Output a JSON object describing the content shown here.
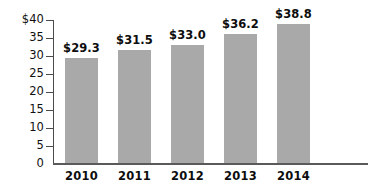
{
  "chart_data": {
    "type": "bar",
    "title": "",
    "subtitle": "",
    "xlabel": "",
    "ylabel": "",
    "categories": [
      "2010",
      "2011",
      "2012",
      "2013",
      "2014"
    ],
    "values": [
      29.3,
      31.5,
      33.0,
      36.2,
      38.8
    ],
    "data_labels": [
      "$29.3",
      "$31.5",
      "$33.0",
      "$36.2",
      "$38.8"
    ],
    "ylim": [
      0,
      40
    ],
    "ytick_values": [
      0,
      5,
      10,
      15,
      20,
      25,
      30,
      35,
      40
    ],
    "ytick_labels": [
      "0",
      "5",
      "10",
      "15",
      "20",
      "25",
      "30",
      "35",
      "$40"
    ],
    "grid": false,
    "legend": false,
    "legend_position": "none",
    "series": [
      {
        "name": "",
        "values": [
          29.3,
          31.5,
          33.0,
          36.2,
          38.8
        ],
        "color": "#a9a9a9"
      }
    ],
    "colors": {
      "bar_fill": "#a9a9a9",
      "axis": "#4b4b4b",
      "text": "#0d0d0d",
      "background": "#ffffff"
    }
  }
}
